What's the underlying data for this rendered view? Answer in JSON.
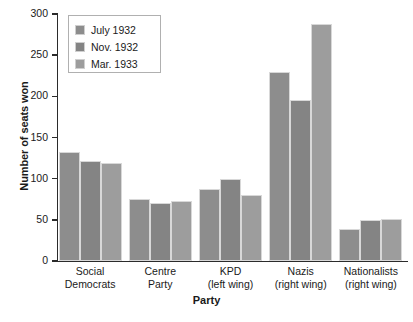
{
  "chart_data": {
    "type": "bar",
    "title": "",
    "xlabel": "Party",
    "ylabel": "Number of seats won",
    "categories": [
      "Social\nDemocrats",
      "Centre\nParty",
      "KPD\n(left wing)",
      "Nazis\n(right wing)",
      "Nationalists\n(right wing)"
    ],
    "category_lines": [
      [
        "Social",
        "Democrats"
      ],
      [
        "Centre",
        "Party"
      ],
      [
        "KPD",
        "(left wing)"
      ],
      [
        "Nazis",
        "(right wing)"
      ],
      [
        "Nationalists",
        "(right wing)"
      ]
    ],
    "series": [
      {
        "name": "July 1932",
        "color": "#8d8d8d",
        "values": [
          133,
          75,
          88,
          230,
          39
        ]
      },
      {
        "name": "Nov. 1932",
        "color": "#848484",
        "values": [
          121,
          70,
          100,
          196,
          50
        ]
      },
      {
        "name": "Mar. 1933",
        "color": "#9d9d9d",
        "values": [
          119,
          73,
          80,
          288,
          51
        ]
      }
    ],
    "ylim": [
      0,
      300
    ],
    "yticks": [
      0,
      50,
      100,
      150,
      200,
      250,
      300
    ],
    "ytick_labels": [
      "0",
      "50",
      "100",
      "150",
      "200",
      "250",
      "300"
    ],
    "grid": false,
    "legend_position": "top-left"
  }
}
